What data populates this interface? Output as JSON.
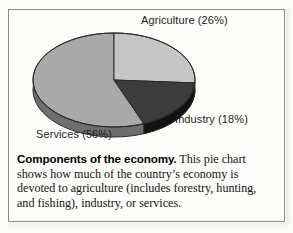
{
  "figure": {
    "border_color": "#8a8a8a",
    "background": "#fdfdfa"
  },
  "labels": {
    "agriculture": "Agriculture (26%)",
    "industry": "Industry (18%)",
    "services": "Services (56%)"
  },
  "caption": {
    "title": "Components of the economy.",
    "body": " This pie chart shows how much of the country’s economy is devoted to agriculture (includes forestry, hunting, and fishing), industry, or services."
  },
  "chart_data": {
    "type": "pie",
    "title": "Components of the economy",
    "categories": [
      "Agriculture",
      "Industry",
      "Services"
    ],
    "values": [
      26,
      18,
      56
    ],
    "value_unit": "%",
    "data_labels": [
      "Agriculture (26%)",
      "Industry (18%)",
      "Services (56%)"
    ],
    "colors": [
      "#c6c6c6",
      "#3c3c3c",
      "#a9a9a9"
    ],
    "side_colors": [
      "#8f8f8f",
      "#111111",
      "#6e6e6e"
    ],
    "outline_color": "#2b2b2b",
    "start_angle_deg": 0,
    "direction": "clockwise",
    "three_d": true,
    "depth_px": 10,
    "legend": "none",
    "grid": false,
    "xlabel": "",
    "ylabel": ""
  }
}
